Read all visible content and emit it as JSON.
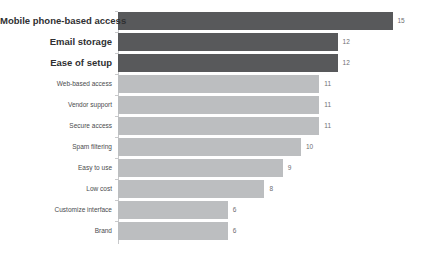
{
  "chart_data": {
    "type": "bar",
    "orientation": "horizontal",
    "title": "",
    "subtitle": "",
    "xlabel": "",
    "ylabel": "",
    "grid": false,
    "legend": false,
    "xlim": [
      0,
      16
    ],
    "axis_line": true,
    "axis_ticks": true,
    "value_labels_shown": true,
    "sort": "descending",
    "categories": [
      "Mobile phone-based access",
      "Email storage",
      "Ease of setup",
      "Web-based access",
      "Vendor support",
      "Secure access",
      "Spam filtering",
      "Easy to use",
      "Low cost",
      "Customize interface",
      "Brand"
    ],
    "values": [
      15,
      12,
      12,
      11,
      11,
      11,
      10,
      9,
      8,
      6,
      6
    ],
    "bars": [
      {
        "category": "Mobile phone-based access",
        "value": 15,
        "tier": "primary",
        "color": "#58595b",
        "emphasis": true
      },
      {
        "category": "Email storage",
        "value": 12,
        "tier": "primary",
        "color": "#58595b",
        "emphasis": true
      },
      {
        "category": "Ease of setup",
        "value": 12,
        "tier": "primary",
        "color": "#58595b",
        "emphasis": true
      },
      {
        "category": "Web-based access",
        "value": 11,
        "tier": "secondary",
        "color": "#bcbec0",
        "emphasis": false
      },
      {
        "category": "Vendor support",
        "value": 11,
        "tier": "secondary",
        "color": "#bcbec0",
        "emphasis": false
      },
      {
        "category": "Secure access",
        "value": 11,
        "tier": "secondary",
        "color": "#bcbec0",
        "emphasis": false
      },
      {
        "category": "Spam filtering",
        "value": 10,
        "tier": "secondary",
        "color": "#bcbec0",
        "emphasis": false
      },
      {
        "category": "Easy to use",
        "value": 9,
        "tier": "secondary",
        "color": "#bcbec0",
        "emphasis": false
      },
      {
        "category": "Low cost",
        "value": 8,
        "tier": "secondary",
        "color": "#bcbec0",
        "emphasis": false
      },
      {
        "category": "Customize interface",
        "value": 6,
        "tier": "secondary",
        "color": "#bcbec0",
        "emphasis": false
      },
      {
        "category": "Brand",
        "value": 6,
        "tier": "secondary",
        "color": "#bcbec0",
        "emphasis": false
      }
    ],
    "colors": {
      "primary_bar": "#58595b",
      "secondary_bar": "#bcbec0",
      "axis": "#c8c9cb",
      "value_label": "#6d6e71",
      "category_label_emphasis": "#2f3032",
      "category_label_normal": "#4a4b4d",
      "background": "#ffffff"
    }
  }
}
